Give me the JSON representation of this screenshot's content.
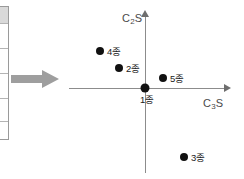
{
  "figure": {
    "background_color": "#ffffff",
    "axis_color": "#8c8c8c",
    "point_color": "#111111",
    "arrow_color": "#9e9e9e"
  },
  "side_arrow": {
    "name": "process-arrow",
    "direction": "right",
    "color": "#9e9e9e"
  },
  "table_fragment": {
    "name": "cropped-table-edge",
    "row_count": 5
  },
  "chart_data": {
    "type": "scatter",
    "title": "",
    "xlabel": "C3S",
    "xlabel_text": "C",
    "xlabel_sub": "3",
    "xlabel_tail": "S",
    "ylabel": "C2S",
    "ylabel_text": "C",
    "ylabel_sub": "2",
    "ylabel_tail": "S",
    "grid": false,
    "legend": false,
    "axis_style": "arrowed-quadrant",
    "origin_px": {
      "x": 145,
      "y": 88
    },
    "xlim": [
      -1.0,
      1.1
    ],
    "ylim": [
      -1.0,
      1.0
    ],
    "points": [
      {
        "label": "1종",
        "x": 0.0,
        "y": 0.0,
        "px": 145,
        "py": 88,
        "label_px": 140,
        "label_py": 99,
        "origin": true
      },
      {
        "label": "2종",
        "x": -0.33,
        "y": 0.28,
        "px": 119,
        "py": 68,
        "label_px": 126,
        "label_py": 68,
        "origin": false
      },
      {
        "label": "3종",
        "x": 0.5,
        "y": -0.87,
        "px": 184,
        "py": 157,
        "label_px": 191,
        "label_py": 157,
        "origin": false
      },
      {
        "label": "4종",
        "x": -0.57,
        "y": 0.52,
        "px": 100,
        "py": 51,
        "label_px": 107,
        "label_py": 51,
        "origin": false
      },
      {
        "label": "5종",
        "x": 0.23,
        "y": 0.13,
        "px": 163,
        "py": 78,
        "label_px": 170,
        "label_py": 78,
        "origin": false
      }
    ]
  }
}
